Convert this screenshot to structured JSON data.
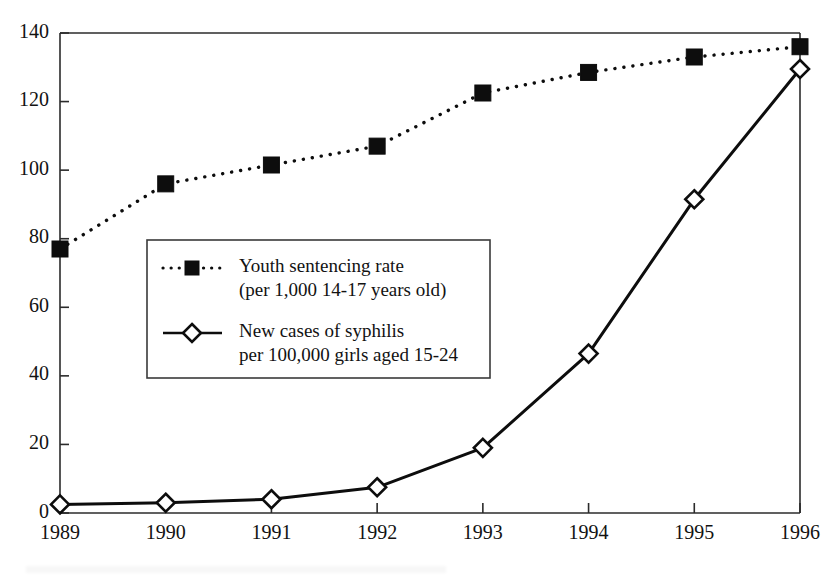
{
  "chart_data": {
    "type": "line",
    "title": "",
    "subtitle": "",
    "xlabel": "",
    "ylabel": "",
    "grid": false,
    "legend_position": "inside-upper-left",
    "categories": [
      "1989",
      "1990",
      "1991",
      "1992",
      "1993",
      "1994",
      "1995",
      "1996"
    ],
    "x": [
      1989,
      1990,
      1991,
      1992,
      1993,
      1994,
      1995,
      1996
    ],
    "xlim": [
      1989,
      1996
    ],
    "ylim": [
      0,
      140
    ],
    "ytick_labels": [
      "0",
      "20",
      "40",
      "60",
      "80",
      "100",
      "120",
      "140"
    ],
    "ytick_values": [
      0,
      20,
      40,
      60,
      80,
      100,
      120,
      140
    ],
    "xtick_labels": [
      "1989",
      "1990",
      "1991",
      "1992",
      "1993",
      "1994",
      "1995",
      "1996"
    ],
    "series": [
      {
        "name": "Youth sentencing rate (per 1,000 14-17 years old)",
        "legend_line1": "Youth sentencing rate",
        "legend_line2": "(per 1,000 14-17 years old)",
        "marker": "filled-square",
        "linestyle": "dotted",
        "color": "#0d0d0d",
        "values": [
          77,
          96,
          101.5,
          107,
          122.5,
          128.5,
          133,
          136
        ]
      },
      {
        "name": "New cases of syphilis per 100,000 girls aged 15-24",
        "legend_line1": "New cases of syphilis",
        "legend_line2": "per 100,000 girls aged 15-24",
        "marker": "open-diamond",
        "linestyle": "solid",
        "color": "#0d0d0d",
        "values": [
          2.5,
          3,
          4,
          7.5,
          19,
          46.5,
          91.5,
          129.5
        ]
      }
    ]
  },
  "colors": {
    "ink": "#0d0d0d",
    "axis": "#2b2b2b",
    "background": "#ffffff",
    "legend_border": "#3a3a3a"
  }
}
